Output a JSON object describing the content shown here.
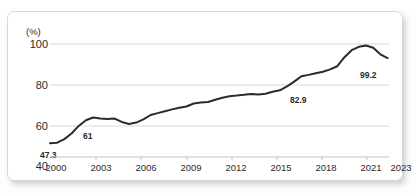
{
  "header": {
    "title_partial": "",
    "title_visible": false
  },
  "card": {
    "background": "#ffffff",
    "border_color": "#d8d8d8"
  },
  "chart_data": {
    "type": "line",
    "title": "",
    "xlabel": "",
    "ylabel": "",
    "unit_label": "(%)",
    "grid": true,
    "legend": false,
    "line_color": "#2b2b2b",
    "grid_color": "#d7d7d7",
    "xlim": [
      2000,
      2023.6
    ],
    "ylim": [
      40,
      103
    ],
    "ytick_labels": [
      "100",
      "80",
      "60",
      "40"
    ],
    "yticks": [
      100,
      80,
      60,
      40
    ],
    "xtick_labels": [
      "2000",
      "2003",
      "2006",
      "2009",
      "2012",
      "2015",
      "2018",
      "2021",
      "2023"
    ],
    "xticks": [
      2000,
      2003,
      2006,
      2009,
      2012,
      2015,
      2018,
      2021,
      2023
    ],
    "x": [
      2000,
      2000.5,
      2001,
      2001.5,
      2002,
      2002.5,
      2003,
      2003.5,
      2004,
      2004.5,
      2005,
      2005.5,
      2006,
      2006.5,
      2007,
      2007.5,
      2008,
      2008.5,
      2009,
      2009.5,
      2010,
      2010.5,
      2011,
      2011.5,
      2012,
      2012.5,
      2013,
      2013.5,
      2014,
      2014.5,
      2015,
      2015.5,
      2016,
      2016.5,
      2017,
      2017.5,
      2018,
      2018.5,
      2019,
      2019.5,
      2020,
      2020.5,
      2021,
      2021.5,
      2022,
      2022.5,
      2023,
      2023.5
    ],
    "values": [
      47.3,
      47.6,
      49.5,
      52.5,
      56.5,
      59.5,
      61.0,
      60.5,
      60.2,
      60.4,
      58.6,
      57.5,
      58.3,
      60.0,
      62.3,
      63.3,
      64.3,
      65.3,
      66.2,
      66.8,
      68.4,
      68.9,
      69.2,
      70.4,
      71.5,
      72.3,
      72.6,
      73.0,
      73.5,
      73.2,
      73.6,
      74.6,
      75.4,
      77.5,
      80.0,
      82.9,
      83.6,
      84.5,
      85.3,
      86.5,
      88.2,
      93.0,
      96.7,
      98.5,
      99.2,
      98.0,
      94.5,
      92.5
    ],
    "annotations": [
      {
        "label": "47.3",
        "x": 2000,
        "y": 47.3
      },
      {
        "label": "61",
        "x": 2003,
        "y": 61.0
      },
      {
        "label": "82.9",
        "x": 2017.5,
        "y": 82.9
      },
      {
        "label": "99.2",
        "x": 2022,
        "y": 99.2
      }
    ]
  }
}
